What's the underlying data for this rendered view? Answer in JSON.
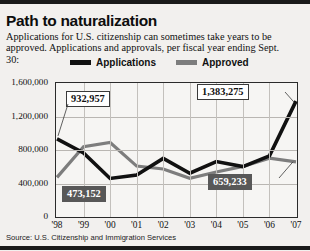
{
  "header": {
    "title": "Path to naturalization",
    "subtitle": "Applications for U.S. citizenship can sometimes take years to be approved. Applications and approvals, per fiscal year ending Sept. 30:"
  },
  "legend": {
    "applications_label": "Applications",
    "approved_label": "Approved",
    "applications_color": "#111111",
    "approved_color": "#7d7d7d"
  },
  "source": {
    "text": "Source: U.S. Citizenship and Immigration Services"
  },
  "callouts": [
    {
      "text": "932,957",
      "style": "light"
    },
    {
      "text": "1,383,275",
      "style": "light"
    },
    {
      "text": "473,152",
      "style": "dark"
    },
    {
      "text": "659,233",
      "style": "dark"
    }
  ],
  "chart_data": {
    "type": "line",
    "title": "Path to naturalization",
    "xlabel": "",
    "ylabel": "",
    "ylim": [
      0,
      1600000
    ],
    "ytick_labels": [
      "1,600,000",
      "1,200,000",
      "800,000",
      "400,000",
      "0"
    ],
    "ytick_values": [
      1600000,
      1200000,
      800000,
      400000,
      0
    ],
    "grid": true,
    "legend_position": "top",
    "categories": [
      "'98",
      "'99",
      "'00",
      "'01",
      "'02",
      "'03",
      "'04",
      "'05",
      "'06",
      "'07"
    ],
    "series": [
      {
        "name": "Applications",
        "color": "#111111",
        "values": [
          932957,
          765000,
          460000,
          501000,
          700000,
          523000,
          662000,
          602000,
          730000,
          1383275
        ]
      },
      {
        "name": "Approved",
        "color": "#7d7d7d",
        "values": [
          473152,
          840000,
          890000,
          608000,
          573000,
          463000,
          537000,
          604000,
          702000,
          659233
        ]
      }
    ],
    "annotations": [
      {
        "label": "932,957",
        "series": "Applications",
        "category": "'98",
        "value": 932957
      },
      {
        "label": "1,383,275",
        "series": "Applications",
        "category": "'07",
        "value": 1383275
      },
      {
        "label": "473,152",
        "series": "Approved",
        "category": "'98",
        "value": 473152
      },
      {
        "label": "659,233",
        "series": "Approved",
        "category": "'07",
        "value": 659233
      }
    ]
  }
}
